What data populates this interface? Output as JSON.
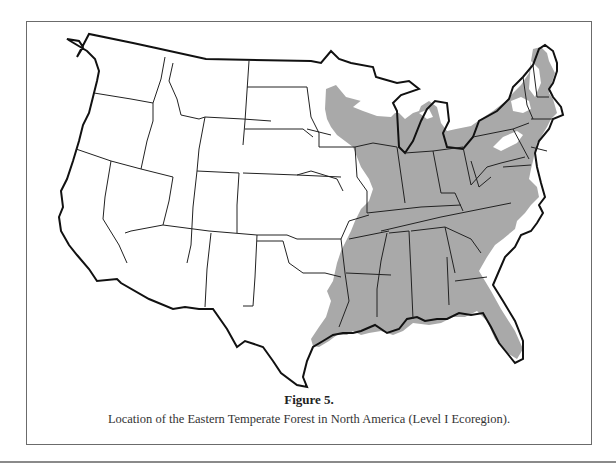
{
  "figure": {
    "label": "Figure 5.",
    "caption": "Location of the Eastern Temperate Forest in North America (Level I Ecoregion).",
    "map": {
      "subject": "Contiguous United States with state boundaries",
      "highlighted_region": "Eastern Temperate Forest (Level I Ecoregion)",
      "colors": {
        "highlight_fill": "#a9a9a9",
        "land_fill": "#ffffff",
        "boundary_stroke": "#111111",
        "frame_stroke": "#6b6b6b"
      }
    }
  }
}
